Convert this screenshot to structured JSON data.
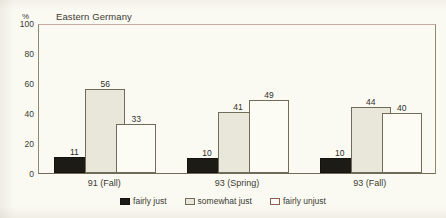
{
  "chart_data": {
    "type": "bar",
    "title": "Eastern Germany",
    "xlabel": "",
    "ylabel": "%",
    "ylim": [
      0,
      100
    ],
    "yticks": [
      0,
      20,
      40,
      60,
      80,
      100
    ],
    "grid": false,
    "legend_position": "bottom",
    "categories": [
      "91 (Fall)",
      "93 (Spring)",
      "93 (Fall)"
    ],
    "series": [
      {
        "name": "fairly just",
        "color": "#1d1b16",
        "values": [
          11,
          10,
          10
        ]
      },
      {
        "name": "somewhat just",
        "color": "#e9e7da",
        "values": [
          56,
          41,
          44
        ]
      },
      {
        "name": "fairly unjust",
        "color": "#fcfbf4",
        "values": [
          33,
          49,
          40
        ]
      }
    ]
  },
  "axis": {
    "unit_label": "%",
    "tick_labels": [
      "100",
      "80",
      "60",
      "40",
      "20",
      "0"
    ]
  },
  "legend": {
    "items": [
      {
        "label": "fairly just"
      },
      {
        "label": "somewhat just"
      },
      {
        "label": "fairly unjust"
      }
    ]
  }
}
